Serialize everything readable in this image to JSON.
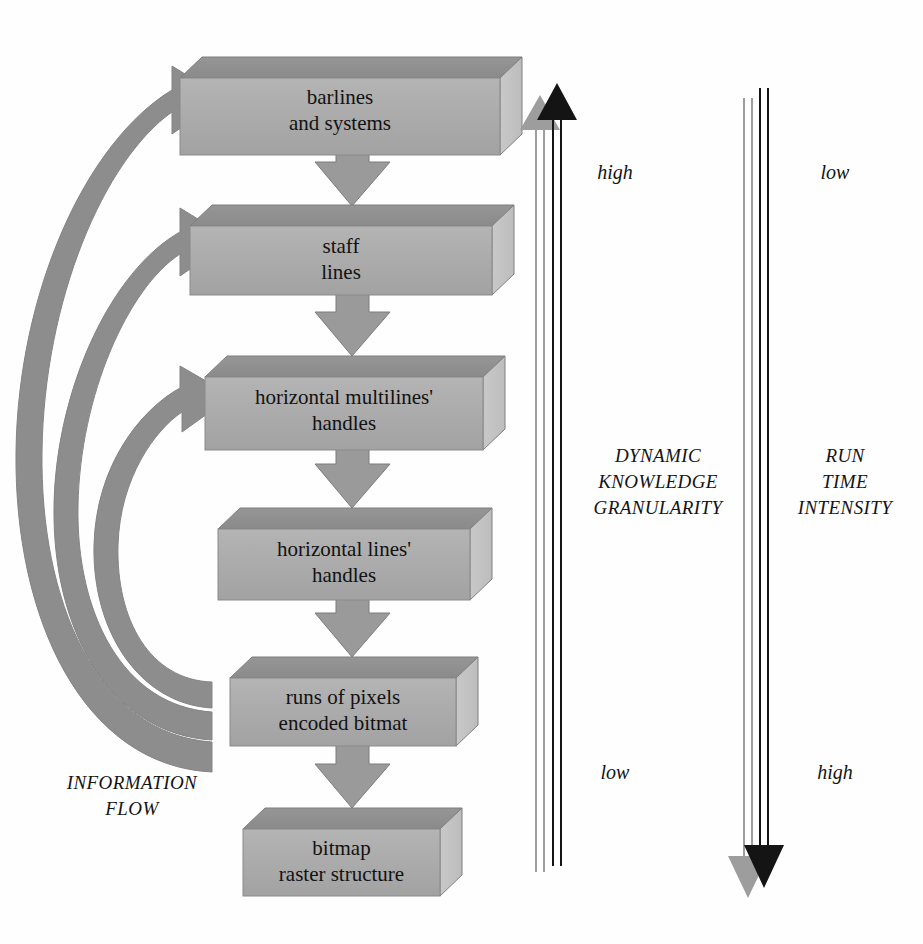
{
  "diagram": {
    "colors": {
      "box_front": "#a9a9a9",
      "box_top": "#8e8e8e",
      "box_side": "#c2c2c2",
      "box_outline": "#8a8a8a",
      "arrow_fill": "#9a9a9a",
      "arrow_outline": "#7d7d7d",
      "curved_arrow": "#8b8b8b",
      "axis_black": "#111111",
      "axis_gray": "#9d9d9d",
      "text": "#121212",
      "background": "#ffffff"
    },
    "layers": [
      {
        "id": "barlines",
        "label": "barlines\nand systems"
      },
      {
        "id": "staff-lines",
        "label": "staff\nlines"
      },
      {
        "id": "multilines",
        "label": "horizontal multilines'\nhandles"
      },
      {
        "id": "lines",
        "label": "horizontal lines'\nhandles"
      },
      {
        "id": "runs",
        "label": "runs of pixels\nencoded bitmat"
      },
      {
        "id": "bitmap",
        "label": "bitmap\nraster structure"
      }
    ],
    "flow_label": "INFORMATION\nFLOW",
    "axes": [
      {
        "id": "dynamic-knowledge-granularity",
        "label": "DYNAMIC\nKNOWLEDGE\nGRANULARITY",
        "top_label": "high",
        "bottom_label": "low",
        "direction": "up"
      },
      {
        "id": "run-time-intensity",
        "label": "RUN\nTIME\nINTENSITY",
        "top_label": "low",
        "bottom_label": "high",
        "direction": "down"
      }
    ],
    "vertical_arrow_count": 5,
    "curved_arrow_count": 3
  }
}
